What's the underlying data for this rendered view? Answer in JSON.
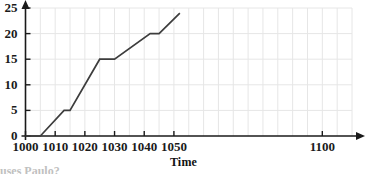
{
  "chart_data": {
    "type": "line",
    "title": "",
    "subtitle": "",
    "xlabel": "Time",
    "ylabel": "",
    "xlim": [
      1000,
      1110
    ],
    "ylim": [
      0,
      25
    ],
    "grid": true,
    "grid_x_step": 5,
    "grid_y_step": 5,
    "legend": "none",
    "axis_arrows": true,
    "x_ticks": [
      1000,
      1010,
      1020,
      1030,
      1040,
      1050,
      1100
    ],
    "x_tick_labels": [
      "1000",
      "1010",
      "1020",
      "1030",
      "1040",
      "1050",
      "1100"
    ],
    "y_ticks": [
      0,
      5,
      10,
      15,
      20,
      25
    ],
    "y_tick_labels": [
      "0",
      "5",
      "10",
      "15",
      "20",
      "25"
    ],
    "series": [
      {
        "name": "distance",
        "color": "#3d3d3d",
        "x": [
          1000,
          1005,
          1013,
          1015,
          1025,
          1030,
          1042,
          1045,
          1052
        ],
        "y": [
          0,
          0,
          5,
          5,
          15,
          15,
          20,
          20,
          24
        ]
      }
    ],
    "annotations": []
  },
  "axis_titles": {
    "x": "Time"
  },
  "captions": {
    "clipped_bottom_text": "uses Paulo?"
  },
  "colors": {
    "line": "#3d3d3d",
    "axis": "#1a1a1a",
    "grid": "#e6e6e6",
    "background": "#ffffff",
    "tick_text": "#1a1a1a"
  }
}
